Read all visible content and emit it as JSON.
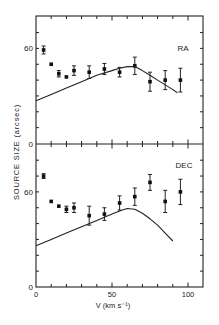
{
  "figure": {
    "ylabel": "SOURCE SIZE  (arcsec)",
    "xlabel": "V  (km s⁻¹)",
    "xticks": [
      0,
      50,
      100
    ],
    "xtick_labels": [
      "0",
      "50",
      "100"
    ]
  },
  "chart_data": [
    {
      "type": "scatter",
      "panel": "top",
      "title": "RA",
      "xlabel": "V (km s^-1)",
      "ylabel": "SOURCE SIZE (arcsec)",
      "xlim": [
        0,
        110
      ],
      "ylim": [
        0,
        80
      ],
      "ytick_labels": [
        "0",
        "60"
      ],
      "grid": false,
      "series": [
        {
          "name": "RA measurements",
          "style": "points-with-errorbars",
          "x": [
            5,
            10,
            15,
            20,
            25,
            35,
            45,
            55,
            65,
            75,
            85,
            95
          ],
          "y": [
            59,
            50,
            44,
            42,
            46,
            45,
            47,
            45,
            49,
            39,
            40,
            40
          ],
          "yerr": [
            2.5,
            0,
            2,
            0,
            3,
            4,
            3.5,
            3,
            5.5,
            6,
            6,
            7.5
          ]
        },
        {
          "name": "RA model",
          "style": "line",
          "x": [
            0,
            10,
            20,
            30,
            40,
            50,
            55,
            60,
            65,
            70,
            75,
            80,
            85,
            90,
            93
          ],
          "y": [
            27,
            31,
            35,
            39,
            43,
            46,
            47.5,
            48.5,
            48.5,
            46,
            43,
            40,
            37,
            34,
            32
          ]
        }
      ]
    },
    {
      "type": "scatter",
      "panel": "bottom",
      "title": "DEC",
      "xlabel": "V (km s^-1)",
      "ylabel": "SOURCE SIZE (arcsec)",
      "xlim": [
        0,
        110
      ],
      "ylim": [
        0,
        90
      ],
      "xticks": [
        0,
        50,
        100
      ],
      "ytick_labels": [
        "0",
        "60"
      ],
      "grid": false,
      "series": [
        {
          "name": "DEC measurements",
          "style": "points-with-errorbars",
          "x": [
            5,
            10,
            15,
            20,
            25,
            35,
            45,
            55,
            65,
            75,
            85,
            95
          ],
          "y": [
            70,
            54,
            51,
            49,
            50,
            45,
            46,
            53,
            57,
            66,
            54,
            60
          ],
          "yerr": [
            1.5,
            0,
            0,
            2,
            3,
            6,
            4,
            4.5,
            5.5,
            5,
            7,
            8
          ]
        },
        {
          "name": "DEC model",
          "style": "line",
          "x": [
            0,
            10,
            20,
            30,
            40,
            50,
            55,
            60,
            65,
            70,
            75,
            80,
            85,
            90
          ],
          "y": [
            26,
            30,
            34,
            38,
            42,
            46,
            48,
            49.5,
            49,
            46.5,
            43,
            39,
            34,
            29
          ]
        }
      ]
    }
  ]
}
